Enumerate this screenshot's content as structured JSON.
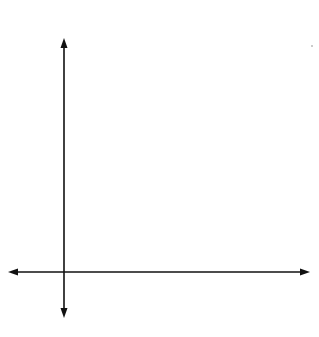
{
  "chart_data": {
    "type": "scatter",
    "title": "",
    "xlabel": "x",
    "ylabel": "y",
    "x_ticks": [
      "1",
      "2",
      "3",
      "4",
      "5",
      "6"
    ],
    "y_ticks": [
      "24",
      "48",
      "72",
      "96",
      "124",
      "144"
    ],
    "grid": true,
    "xlim": [
      -1,
      7
    ],
    "ylim": [
      -1,
      6
    ],
    "series": [],
    "note": "Blank coordinate grid with arrowed axes"
  },
  "labels": {
    "x_axis": "x",
    "y_axis": "y",
    "x_ticks": [
      "1",
      "2",
      "3",
      "4",
      "5",
      "6"
    ],
    "y_ticks": [
      "24",
      "48",
      "72",
      "96",
      "124",
      "144"
    ]
  },
  "colors": {
    "grid": "#b8b8b8",
    "axis": "#111111"
  }
}
